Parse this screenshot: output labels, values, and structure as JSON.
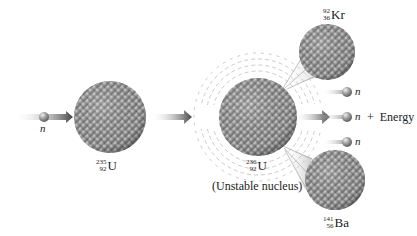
{
  "diagram": {
    "incoming_neutron": {
      "label": "n"
    },
    "reactant": {
      "mass": "235",
      "atomic": "92",
      "symbol": "U"
    },
    "intermediate": {
      "mass": "236",
      "atomic": "92",
      "symbol": "U",
      "caption": "(Unstable nucleus)"
    },
    "product_kr": {
      "mass": "92",
      "atomic": "36",
      "symbol": "Kr"
    },
    "product_ba": {
      "mass": "141",
      "atomic": "56",
      "symbol": "Ba"
    },
    "released_neutrons": [
      {
        "label": "n"
      },
      {
        "label": "n"
      },
      {
        "label": "n"
      }
    ],
    "energy_label": "+  Energy",
    "colors": {
      "nucleon": "#9a9a9a",
      "nucleon_highlight": "#dcdcdc",
      "arrow": "#555555",
      "vibration": "#b0b0b0"
    }
  }
}
